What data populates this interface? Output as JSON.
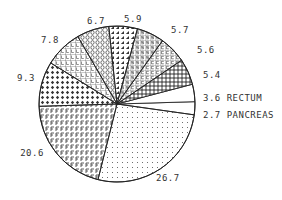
{
  "chart_data": {
    "type": "pie",
    "title": "",
    "start_angle_deg": -8,
    "direction": "counterclockwise",
    "slices": [
      {
        "label": "PANCREAS",
        "value": 2.7,
        "display": "2.7 PANCREAS",
        "pattern": "blank"
      },
      {
        "label": "RECTUM",
        "value": 3.6,
        "display": "3.6 RECTUM",
        "pattern": "blank"
      },
      {
        "label": "",
        "value": 5.4,
        "display": "5.4",
        "pattern": "dense-grid"
      },
      {
        "label": "",
        "value": 5.6,
        "display": "5.6",
        "pattern": "grid-c"
      },
      {
        "label": "",
        "value": 5.7,
        "display": "5.7",
        "pattern": "grid-s"
      },
      {
        "label": "",
        "value": 5.9,
        "display": "5.9",
        "pattern": "triangles"
      },
      {
        "label": "",
        "value": 6.7,
        "display": "6.7",
        "pattern": "grid-o"
      },
      {
        "label": "",
        "value": 7.8,
        "display": "7.8",
        "pattern": "grid-l"
      },
      {
        "label": "",
        "value": 9.3,
        "display": "9.3",
        "pattern": "diamonds"
      },
      {
        "label": "",
        "value": 20.6,
        "display": "20.6",
        "pattern": "grid-f"
      },
      {
        "label": "",
        "value": 26.7,
        "display": "26.7",
        "pattern": "dots"
      }
    ],
    "legend": "none",
    "label_position": "outside"
  },
  "colors": {
    "stroke": "#222222",
    "text": "#333333",
    "background": "#ffffff"
  }
}
